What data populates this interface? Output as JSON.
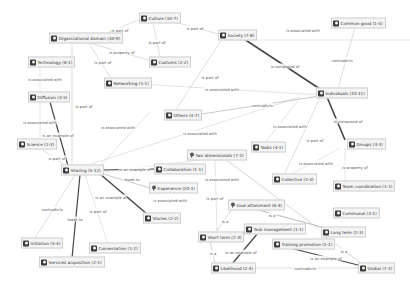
{
  "graph": {
    "nodes": [
      {
        "id": "culture",
        "label": "Culture (10-7)",
        "x": 143,
        "y": 18,
        "icon": "concept-icon"
      },
      {
        "id": "org_domain",
        "label": "Organizational domain (40-9)",
        "x": 53,
        "y": 38,
        "icon": "concept-icon"
      },
      {
        "id": "society",
        "label": "Society (7-8)",
        "x": 222,
        "y": 35,
        "icon": "concept-icon"
      },
      {
        "id": "common_good",
        "label": "Common good (1-4)",
        "x": 335,
        "y": 23,
        "icon": "concept-icon"
      },
      {
        "id": "technology",
        "label": "Technology (6-1)",
        "x": 32,
        "y": 62,
        "icon": "concept-icon"
      },
      {
        "id": "customs",
        "label": "Customs (2-2)",
        "x": 153,
        "y": 62,
        "icon": "concept-icon"
      },
      {
        "id": "networking",
        "label": "Networking (1-1)",
        "x": 108,
        "y": 83,
        "icon": "concept-icon"
      },
      {
        "id": "individuals",
        "label": "Individuals (33-11)",
        "x": 320,
        "y": 93,
        "icon": "concept-icon"
      },
      {
        "id": "diffusion",
        "label": "Diffusion (3-5)",
        "x": 32,
        "y": 97,
        "icon": "concept-icon"
      },
      {
        "id": "others",
        "label": "Others (4-7)",
        "x": 168,
        "y": 115,
        "icon": "concept-icon"
      },
      {
        "id": "science",
        "label": "Science (2-3)",
        "x": 21,
        "y": 144,
        "icon": "concept-icon"
      },
      {
        "id": "groups",
        "label": "Groups (3-3)",
        "x": 351,
        "y": 144,
        "icon": "concept-icon"
      },
      {
        "id": "tasks",
        "label": "Tasks (4-1)",
        "x": 255,
        "y": 147,
        "icon": "concept-icon"
      },
      {
        "id": "sharing",
        "label": "Sharing (5-12)",
        "x": 65,
        "y": 170,
        "icon": "concept-icon"
      },
      {
        "id": "two_dim",
        "label": "Two dimensionals (7-2)",
        "x": 191,
        "y": 155,
        "icon": "idea-icon"
      },
      {
        "id": "collaboration",
        "label": "Collaboration (1-1)",
        "x": 158,
        "y": 169,
        "icon": "concept-icon"
      },
      {
        "id": "collective",
        "label": "Collective (3-4)",
        "x": 276,
        "y": 179,
        "icon": "concept-icon"
      },
      {
        "id": "experience",
        "label": "Experience (20-1)",
        "x": 153,
        "y": 188,
        "icon": "idea-icon"
      },
      {
        "id": "team_coord",
        "label": "Team coordination (1-1)",
        "x": 337,
        "y": 186,
        "icon": "concept-icon"
      },
      {
        "id": "goal_attain",
        "label": "Goal attainment (6-4)",
        "x": 232,
        "y": 205,
        "icon": "idea-icon"
      },
      {
        "id": "stories",
        "label": "Stories (2-2)",
        "x": 147,
        "y": 218,
        "icon": "concept-icon"
      },
      {
        "id": "communal",
        "label": "Communal (3-1)",
        "x": 337,
        "y": 213,
        "icon": "concept-icon"
      },
      {
        "id": "task_mgmt",
        "label": "Task management (1-1)",
        "x": 248,
        "y": 229,
        "icon": "concept-icon"
      },
      {
        "id": "long_term",
        "label": "Long term (2-3)",
        "x": 325,
        "y": 232,
        "icon": "concept-icon"
      },
      {
        "id": "initiation",
        "label": "Initiation (5-4)",
        "x": 25,
        "y": 243,
        "icon": "concept-icon"
      },
      {
        "id": "short_term",
        "label": "Short term (2-3)",
        "x": 202,
        "y": 237,
        "icon": "concept-icon"
      },
      {
        "id": "conversation",
        "label": "Conversation (1-2)",
        "x": 93,
        "y": 248,
        "icon": "concept-icon"
      },
      {
        "id": "training_promo",
        "label": "Training promotion (1-1)",
        "x": 276,
        "y": 244,
        "icon": "concept-icon"
      },
      {
        "id": "services_acq",
        "label": "Services acquisition (2-1)",
        "x": 43,
        "y": 262,
        "icon": "concept-icon"
      },
      {
        "id": "likelihood",
        "label": "Likelihood (2-4)",
        "x": 215,
        "y": 268,
        "icon": "concept-icon"
      },
      {
        "id": "global",
        "label": "Global (7-3)",
        "x": 362,
        "y": 268,
        "icon": "concept-icon"
      }
    ],
    "edges": [
      {
        "from": [
          95,
          38
        ],
        "to": [
          143,
          18
        ],
        "label": "is part of",
        "lx": 120,
        "ly": 30,
        "w": 0.5
      },
      {
        "from": [
          160,
          18
        ],
        "to": [
          222,
          35
        ],
        "label": "is part of",
        "lx": 195,
        "ly": 28,
        "w": 0.5
      },
      {
        "from": [
          153,
          22
        ],
        "to": [
          160,
          58
        ],
        "label": "is part of",
        "lx": 157,
        "ly": 42,
        "w": 0.5
      },
      {
        "from": [
          86,
          42
        ],
        "to": [
          155,
          62
        ],
        "label": "is property of",
        "lx": 122,
        "ly": 52,
        "w": 0.5
      },
      {
        "from": [
          88,
          42
        ],
        "to": [
          112,
          80
        ],
        "label": "is part of",
        "lx": 103,
        "ly": 62,
        "w": 0.5
      },
      {
        "from": [
          222,
          39
        ],
        "to": [
          175,
          111
        ],
        "label": "is part of",
        "lx": 210,
        "ly": 77,
        "w": 0.5
      },
      {
        "from": [
          238,
          35
        ],
        "to": [
          320,
          89
        ],
        "label": "is composed of",
        "lx": 285,
        "ly": 66,
        "w": 1.5
      },
      {
        "from": [
          355,
          27
        ],
        "to": [
          338,
          89
        ],
        "label": "contradicts",
        "lx": 342,
        "ly": 60,
        "w": 0.5
      },
      {
        "from": [
          240,
          40
        ],
        "to": [
          410,
          40
        ],
        "label": "is associated with",
        "lx": 303,
        "ly": 30,
        "w": 0.4
      },
      {
        "from": [
          140,
          84
        ],
        "to": [
          320,
          95
        ],
        "label": "is associated with",
        "lx": 222,
        "ly": 89,
        "w": 0.4
      },
      {
        "from": [
          72,
          42
        ],
        "to": [
          72,
          166
        ],
        "label": "is part of",
        "lx": 84,
        "ly": 106,
        "w": 0.5
      },
      {
        "from": [
          40,
          66
        ],
        "to": [
          40,
          93
        ],
        "label": "is associated with",
        "lx": 45,
        "ly": 79,
        "w": 0.4
      },
      {
        "from": [
          50,
          102
        ],
        "to": [
          68,
          166
        ],
        "label": "is an example of",
        "lx": 58,
        "ly": 135,
        "w": 1.2
      },
      {
        "from": [
          40,
          101
        ],
        "to": [
          40,
          140
        ],
        "label": "is associated with",
        "lx": 40,
        "ly": 122,
        "w": 0.4
      },
      {
        "from": [
          40,
          148
        ],
        "to": [
          66,
          166
        ],
        "label": "is part of",
        "lx": 57,
        "ly": 158,
        "w": 0.5
      },
      {
        "from": [
          195,
          115
        ],
        "to": [
          320,
          96
        ],
        "label": "contradicts",
        "lx": 262,
        "ly": 105,
        "w": 0.8
      },
      {
        "from": [
          150,
          112
        ],
        "to": [
          100,
          166
        ],
        "label": "is associated with",
        "lx": 118,
        "ly": 127,
        "w": 0.4
      },
      {
        "from": [
          300,
          97
        ],
        "to": [
          85,
          166
        ],
        "label": "is associated with",
        "lx": 200,
        "ly": 133,
        "w": 0.4
      },
      {
        "from": [
          327,
          97
        ],
        "to": [
          345,
          140
        ],
        "label": "is composed of",
        "lx": 348,
        "ly": 121,
        "w": 1.6
      },
      {
        "from": [
          320,
          98
        ],
        "to": [
          284,
          175
        ],
        "label": "is part of",
        "lx": 315,
        "ly": 140,
        "w": 0.5
      },
      {
        "from": [
          300,
          98
        ],
        "to": [
          265,
          143
        ],
        "label": "is associated with",
        "lx": 290,
        "ly": 126,
        "w": 0.4
      },
      {
        "from": [
          345,
          148
        ],
        "to": [
          345,
          182
        ],
        "label": "is property of",
        "lx": 355,
        "ly": 167,
        "w": 0.4
      },
      {
        "from": [
          340,
          148
        ],
        "to": [
          290,
          175
        ],
        "label": "is associated with",
        "lx": 316,
        "ly": 163,
        "w": 0.4
      },
      {
        "from": [
          156,
          169
        ],
        "to": [
          101,
          170
        ],
        "label": "is an example of",
        "lx": 135,
        "ly": 169,
        "w": 1.2
      },
      {
        "from": [
          150,
          188
        ],
        "to": [
          100,
          173
        ],
        "label": "leads to",
        "lx": 132,
        "ly": 179,
        "w": 0.8
      },
      {
        "from": [
          100,
          174
        ],
        "to": [
          147,
          214
        ],
        "label": "is an example of",
        "lx": 111,
        "ly": 197,
        "w": 1.4
      },
      {
        "from": [
          80,
          175
        ],
        "to": [
          200,
          160
        ],
        "label": "is associated with",
        "lx": 170,
        "ly": 200,
        "w": 0.4
      },
      {
        "from": [
          75,
          175
        ],
        "to": [
          35,
          238
        ],
        "label": "contradicts",
        "lx": 52,
        "ly": 209,
        "w": 0.5
      },
      {
        "from": [
          80,
          175
        ],
        "to": [
          72,
          258
        ],
        "label": "leads to",
        "lx": 75,
        "ly": 219,
        "w": 1.2
      },
      {
        "from": [
          85,
          175
        ],
        "to": [
          108,
          244
        ],
        "label": "is part of",
        "lx": 98,
        "ly": 211,
        "w": 0.4
      },
      {
        "from": [
          215,
          159
        ],
        "to": [
          217,
          233
        ],
        "label": "is part of",
        "lx": 215,
        "ly": 198,
        "w": 0.4
      },
      {
        "from": [
          225,
          159
        ],
        "to": [
          318,
          228
        ],
        "label": "is associated with",
        "lx": 222,
        "ly": 179,
        "w": 0.6
      },
      {
        "from": [
          240,
          205
        ],
        "to": [
          325,
          228
        ],
        "label": "is a",
        "lx": 272,
        "ly": 215,
        "w": 1.0
      },
      {
        "from": [
          232,
          209
        ],
        "to": [
          215,
          233
        ],
        "label": "is a",
        "lx": 225,
        "ly": 221,
        "w": 0.6
      },
      {
        "from": [
          210,
          241
        ],
        "to": [
          215,
          264
        ],
        "label": "is a",
        "lx": 213,
        "ly": 253,
        "w": 0.6
      },
      {
        "from": [
          258,
          233
        ],
        "to": [
          232,
          264
        ],
        "label": "is an example of",
        "lx": 241,
        "ly": 252,
        "w": 1.2
      },
      {
        "from": [
          325,
          236
        ],
        "to": [
          362,
          264
        ],
        "label": "is a",
        "lx": 344,
        "ly": 251,
        "w": 0.6
      },
      {
        "from": [
          290,
          248
        ],
        "to": [
          362,
          266
        ],
        "label": "is an example of",
        "lx": 326,
        "ly": 258,
        "w": 1.2
      },
      {
        "from": [
          245,
          268
        ],
        "to": [
          362,
          268
        ],
        "label": "contradicts",
        "lx": 305,
        "ly": 268,
        "w": 0.5
      }
    ]
  }
}
